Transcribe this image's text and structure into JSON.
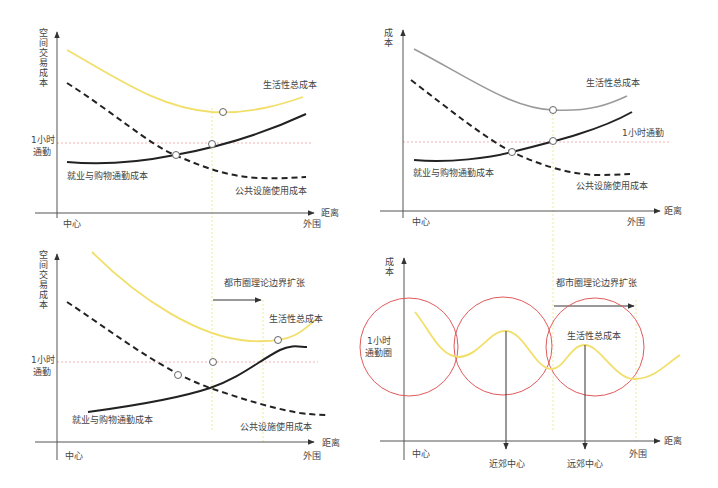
{
  "colors": {
    "total_cost": "#f2df6b",
    "total_cost_gray": "#9a9a9a",
    "commute": "#222222",
    "facility": "#222222",
    "one_hour_line": "#f0a0a0",
    "boundary": "#ecec9a",
    "circle": "#e05a5a",
    "axis": "#555555"
  },
  "panels": [
    {
      "id": "top-left",
      "y_axis_label": [
        "空",
        "间",
        "交",
        "易",
        "成",
        "本"
      ],
      "x_axis_label": "距离",
      "origin_label": "中心",
      "x_end_label": "外围",
      "one_hour_label": [
        "1小时",
        "通勤"
      ],
      "total_cost_label": "生活性总成本",
      "commute_label": "就业与购物通勤成本",
      "facility_label": "公共设施使用成本"
    },
    {
      "id": "top-right",
      "y_axis_label": [
        "成",
        "本"
      ],
      "x_axis_label": "距离",
      "origin_label": "中心",
      "x_end_label": "外围",
      "one_hour_label": [
        "1小时通勤"
      ],
      "total_cost_label": "生活性总成本",
      "commute_label": "就业与购物通勤成本",
      "facility_label": "公共设施使用成本"
    },
    {
      "id": "bottom-left",
      "y_axis_label": [
        "空",
        "间",
        "交",
        "易",
        "成",
        "本"
      ],
      "x_axis_label": "距离",
      "origin_label": "中心",
      "x_end_label": "外围",
      "one_hour_label": [
        "1小时",
        "通勤"
      ],
      "total_cost_label": "生活性总成本",
      "commute_label": "就业与购物通勤成本",
      "facility_label": "公共设施使用成本",
      "expansion_label": "都市圈理论边界扩张"
    },
    {
      "id": "bottom-right",
      "y_axis_label": [
        "成",
        "本"
      ],
      "x_axis_label": "距离",
      "origin_label": "中心",
      "x_end_label": "外围",
      "circle_label": [
        "1小时",
        "通勤圈"
      ],
      "total_cost_label": "生活性总成本",
      "expansion_label": "都市圈理论边界扩张",
      "subcenter_labels": [
        "近郊中心",
        "远郊中心"
      ]
    }
  ]
}
